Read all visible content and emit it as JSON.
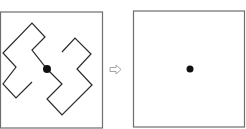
{
  "diagram": {
    "colors": {
      "frame": "#6e6e6e",
      "path": "#2a2a2a",
      "dot": "#111111",
      "arrow": "#9a9a9a"
    },
    "left_panel": {
      "frame": {
        "x": 0.5,
        "y": 12,
        "w": 102,
        "h": 116
      },
      "path_points": "32,82 16,98 3,84 16,67 3,53 32,23 45,37 32,50 47,69 62,84 47,99 62,115 92,85 77,69 91,54 75,38 62,52",
      "dot": {
        "cx": 47,
        "cy": 69,
        "r": 4
      }
    },
    "arrow": {
      "type": "hollow-right-arrow",
      "x": 110,
      "y": 65,
      "w": 11,
      "h": 9
    },
    "right_panel": {
      "frame": {
        "x": 133.5,
        "y": 11,
        "w": 111,
        "h": 116
      },
      "dot": {
        "cx": 190,
        "cy": 69,
        "r": 3.5
      }
    }
  }
}
